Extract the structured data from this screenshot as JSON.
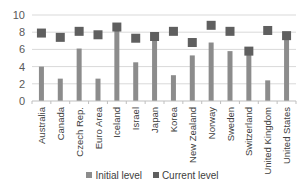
{
  "chart_data": {
    "type": "bar",
    "title": "",
    "xlabel": "",
    "ylabel": "",
    "ylim": [
      0,
      10
    ],
    "yticks": [
      0,
      2,
      4,
      6,
      8,
      10
    ],
    "grid": true,
    "legend_position": "bottom",
    "categories": [
      "Australia",
      "Canada",
      "Czech Rep.",
      "Euro Area",
      "Iceland",
      "Israel",
      "Japan",
      "Korea",
      "New Zealand",
      "Norway",
      "Sweden",
      "Switzerland",
      "United Kingdom",
      "United States"
    ],
    "series": [
      {
        "name": "Initial level",
        "kind": "bar",
        "color": "#8c8c8c",
        "values": [
          4.0,
          2.6,
          6.1,
          2.6,
          8.2,
          4.5,
          7.3,
          3.0,
          5.3,
          6.8,
          5.8,
          5.4,
          2.4,
          7.4
        ]
      },
      {
        "name": "Current level",
        "kind": "marker",
        "color": "#5f5f5f",
        "values": [
          7.9,
          7.4,
          8.1,
          7.7,
          8.6,
          7.3,
          7.5,
          8.1,
          6.8,
          8.8,
          8.1,
          5.8,
          8.2,
          7.6
        ]
      }
    ]
  },
  "legend": {
    "initial_label": "Initial level",
    "current_label": "Current level"
  }
}
